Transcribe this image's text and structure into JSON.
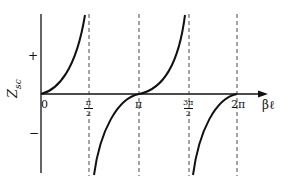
{
  "figure": {
    "y_axis": {
      "label_main": "Z",
      "label_sub": "sc",
      "plus_label": "+",
      "minus_label": "−"
    },
    "x_axis": {
      "label": "βℓ",
      "ticks": [
        {
          "id": "zero",
          "text": "0"
        },
        {
          "id": "half_pi",
          "num": "π",
          "den": "2"
        },
        {
          "id": "pi",
          "text": "π"
        },
        {
          "id": "three_half_pi",
          "num": "3π",
          "den": "2"
        },
        {
          "id": "two_pi",
          "text": "2π"
        }
      ]
    },
    "asymptotes": [
      "π/2",
      "3π/2",
      "2π"
    ],
    "curve": "Z_sc = jZ0 tan(βℓ)",
    "colors": {
      "ink": "#111111",
      "background": "#ffffff"
    }
  }
}
